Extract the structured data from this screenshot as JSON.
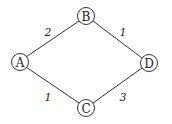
{
  "graph": {
    "nodes": [
      {
        "id": "A",
        "label": "A",
        "x": 20,
        "y": 62
      },
      {
        "id": "B",
        "label": "B",
        "x": 86,
        "y": 16
      },
      {
        "id": "C",
        "label": "C",
        "x": 86,
        "y": 108
      },
      {
        "id": "D",
        "label": "D",
        "x": 149,
        "y": 63
      }
    ],
    "edges": [
      {
        "from": "A",
        "to": "B",
        "weight": "2",
        "label_x": 48,
        "label_y": 36
      },
      {
        "from": "B",
        "to": "D",
        "weight": "1",
        "label_x": 123,
        "label_y": 36
      },
      {
        "from": "A",
        "to": "C",
        "weight": "1",
        "label_x": 48,
        "label_y": 101
      },
      {
        "from": "C",
        "to": "D",
        "weight": "3",
        "label_x": 123,
        "label_y": 101
      }
    ]
  }
}
